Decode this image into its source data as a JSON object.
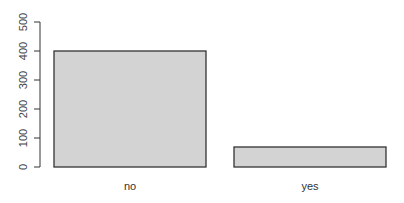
{
  "chart_data": {
    "type": "bar",
    "title": "",
    "xlabel": "",
    "ylabel": "",
    "categories": [
      "no",
      "yes"
    ],
    "values": [
      400,
      69
    ],
    "ylim": [
      0,
      500
    ],
    "yticks": [
      0,
      100,
      200,
      300,
      400,
      500
    ],
    "grid": false,
    "legend": null,
    "bar_fill": "#d3d3d3",
    "bar_stroke": "#333333"
  }
}
